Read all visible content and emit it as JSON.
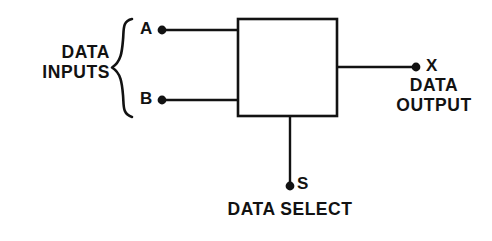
{
  "diagram": {
    "colors": {
      "stroke": "#121212",
      "background": "#ffffff",
      "text": "#121212"
    },
    "block": {
      "x": 238,
      "y": 19,
      "width": 99,
      "height": 97,
      "stroke_width": 2.6,
      "fill": "#ffffff"
    },
    "labels": {
      "data_inputs": "DATA\nINPUTS",
      "input_a": "A",
      "input_b": "B",
      "output_x": "X",
      "data_output": "DATA\nOUTPUT",
      "select_s": "S",
      "data_select": "DATA SELECT"
    },
    "brace": {
      "x_left": 110,
      "x_right": 133,
      "y_top": 18,
      "y_bottom": 118,
      "y_mid": 68
    },
    "signals": [
      {
        "name": "input-a",
        "label": "A",
        "terminal_x": 162,
        "terminal_y": 30,
        "line_from_x": 162,
        "line_to_x": 239,
        "orientation": "horizontal",
        "dot_radius": 4.4
      },
      {
        "name": "input-b",
        "label": "B",
        "terminal_x": 162,
        "terminal_y": 100,
        "line_from_x": 162,
        "line_to_x": 239,
        "orientation": "horizontal",
        "dot_radius": 4.4
      },
      {
        "name": "output-x",
        "label": "X",
        "terminal_x": 416,
        "terminal_y": 67,
        "line_from_x": 336,
        "line_to_x": 416,
        "orientation": "horizontal",
        "dot_radius": 4.4
      },
      {
        "name": "select-s",
        "label": "S",
        "terminal_x": 290,
        "terminal_y": 186,
        "line_from_y": 115,
        "line_to_y": 186,
        "orientation": "vertical",
        "dot_radius": 4.4
      }
    ]
  }
}
